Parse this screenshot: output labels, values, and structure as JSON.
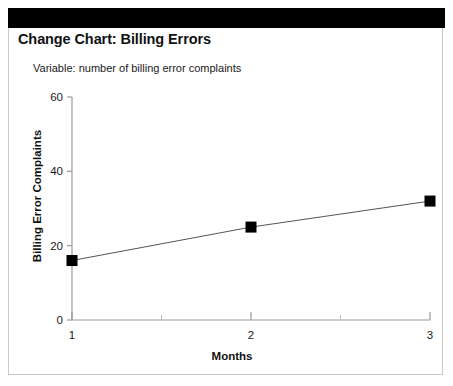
{
  "header": {
    "banner_color": "#000000",
    "title": "Change Chart: Billing Errors",
    "subtitle": "Variable: number of billing error complaints"
  },
  "chart_data": {
    "type": "line",
    "title": "Change Chart: Billing Errors",
    "subtitle": "Variable: number of billing error complaints",
    "xlabel": "Months",
    "ylabel": "Billing Error Complaints",
    "x": [
      1,
      2,
      3
    ],
    "categories": [
      "1",
      "2",
      "3"
    ],
    "values": [
      16,
      25,
      32
    ],
    "series": [
      {
        "name": "Billing Error Complaints",
        "values": [
          16,
          25,
          32
        ]
      }
    ],
    "xlim": [
      1,
      3
    ],
    "ylim": [
      0,
      60
    ],
    "ytick_labels": [
      "0",
      "20",
      "40",
      "60"
    ],
    "ytick_values": [
      0,
      20,
      40,
      60
    ],
    "xtick_labels": [
      "1",
      "2",
      "3"
    ],
    "xtick_values": [
      1,
      2,
      3
    ],
    "minor_xtick_values": [
      1.5,
      2.5
    ],
    "grid": "off",
    "legend": "none",
    "marker": "square",
    "marker_color": "#000000",
    "line_color": "#555555",
    "axis_color": "#9a9a9a"
  }
}
